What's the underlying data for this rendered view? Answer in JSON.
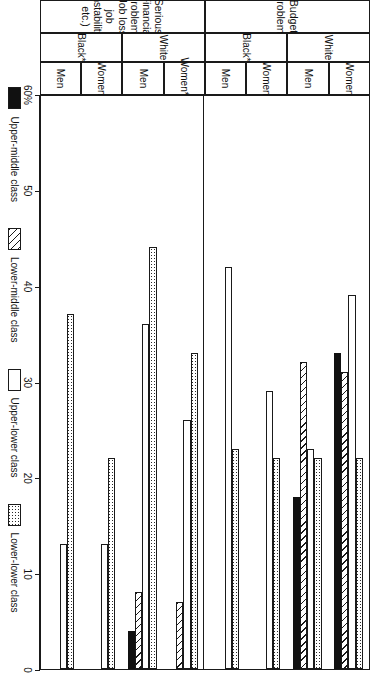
{
  "figure": {
    "sections": [
      {
        "label": "Budget Problems"
      },
      {
        "label": "Serious Financial Problems\n(Job loss, job instability, etc.)"
      }
    ],
    "race_groups": [
      "White",
      "Black*",
      "White",
      "Black*"
    ],
    "sex_groups": [
      "Women",
      "Men",
      "Women",
      "Men",
      "Women**",
      "Men",
      "Women",
      "Men"
    ],
    "axis": {
      "ticks": [
        "60%",
        "50",
        "40",
        "30",
        "20",
        "10",
        "0"
      ],
      "max": 60,
      "min": 0
    },
    "legend": [
      {
        "key": "upper_middle",
        "label": "Upper-middle class",
        "pattern": "solid-black"
      },
      {
        "key": "lower_middle",
        "label": "Lower-middle class",
        "pattern": "diagonal-hatch"
      },
      {
        "key": "upper_lower",
        "label": "Upper-lower class",
        "pattern": "white-empty"
      },
      {
        "key": "lower_lower",
        "label": "Lower-lower class",
        "pattern": "dotted"
      }
    ]
  },
  "chart_data": {
    "type": "bar",
    "title": "",
    "xlabel": "",
    "ylabel": "",
    "orientation": "horizontal",
    "ylim": [
      0,
      60
    ],
    "grid": false,
    "legend_position": "bottom",
    "axis_ticks": [
      60,
      50,
      40,
      30,
      20,
      10,
      0
    ],
    "axis_tick_labels": [
      "60%",
      "50",
      "40",
      "30",
      "20",
      "10",
      "0"
    ],
    "series": [
      {
        "name": "Upper-middle class",
        "pattern": "solid-black"
      },
      {
        "name": "Lower-middle class",
        "pattern": "diagonal-hatch"
      },
      {
        "name": "Upper-lower class",
        "pattern": "white-empty"
      },
      {
        "name": "Lower-lower class",
        "pattern": "dotted"
      }
    ],
    "panels": [
      {
        "name": "Budget Problems",
        "groups": [
          {
            "race": "White",
            "sex": "Women",
            "values": {
              "upper_middle": 33,
              "lower_middle": 31,
              "upper_lower": 39,
              "lower_lower": 22
            }
          },
          {
            "race": "White",
            "sex": "Men",
            "values": {
              "upper_middle": 18,
              "lower_middle": 32,
              "upper_lower": 23,
              "lower_lower": 22
            }
          },
          {
            "race": "Black*",
            "sex": "Women",
            "values": {
              "upper_middle": 0,
              "lower_middle": 0,
              "upper_lower": 29,
              "lower_lower": 22
            }
          },
          {
            "race": "Black*",
            "sex": "Men",
            "values": {
              "upper_middle": 0,
              "lower_middle": 0,
              "upper_lower": 42,
              "lower_lower": 23
            }
          }
        ]
      },
      {
        "name": "Serious Financial Problems (Job loss, job instability, etc.)",
        "groups": [
          {
            "race": "White",
            "sex": "Women**",
            "values": {
              "upper_middle": 0,
              "lower_middle": 7,
              "upper_lower": 26,
              "lower_lower": 33
            }
          },
          {
            "race": "White",
            "sex": "Men",
            "values": {
              "upper_middle": 4,
              "lower_middle": 8,
              "upper_lower": 36,
              "lower_lower": 44
            }
          },
          {
            "race": "Black*",
            "sex": "Women",
            "values": {
              "upper_middle": 0,
              "lower_middle": 0,
              "upper_lower": 13,
              "lower_lower": 22
            }
          },
          {
            "race": "Black*",
            "sex": "Men",
            "values": {
              "upper_middle": 0,
              "lower_middle": 0,
              "upper_lower": 13,
              "lower_lower": 37
            }
          }
        ]
      }
    ]
  }
}
